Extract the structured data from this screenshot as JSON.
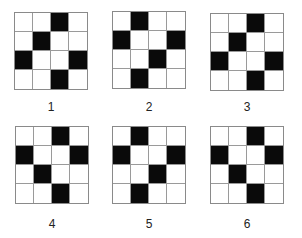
{
  "figure": {
    "grid_size": 4,
    "fill_color": "#0a0a0a",
    "panels": [
      {
        "label": "1",
        "cells": [
          [
            0,
            0,
            1,
            0
          ],
          [
            0,
            1,
            0,
            0
          ],
          [
            1,
            0,
            0,
            1
          ],
          [
            0,
            0,
            1,
            0
          ]
        ]
      },
      {
        "label": "2",
        "cells": [
          [
            0,
            1,
            0,
            0
          ],
          [
            1,
            0,
            0,
            1
          ],
          [
            0,
            0,
            1,
            0
          ],
          [
            0,
            1,
            0,
            0
          ]
        ]
      },
      {
        "label": "3",
        "cells": [
          [
            0,
            0,
            1,
            0
          ],
          [
            0,
            1,
            0,
            0
          ],
          [
            1,
            0,
            0,
            1
          ],
          [
            0,
            0,
            1,
            0
          ]
        ]
      },
      {
        "label": "4",
        "cells": [
          [
            0,
            0,
            1,
            0
          ],
          [
            1,
            0,
            0,
            1
          ],
          [
            0,
            1,
            0,
            0
          ],
          [
            0,
            0,
            1,
            0
          ]
        ]
      },
      {
        "label": "5",
        "cells": [
          [
            0,
            1,
            0,
            0
          ],
          [
            1,
            0,
            0,
            1
          ],
          [
            0,
            0,
            1,
            0
          ],
          [
            0,
            1,
            0,
            0
          ]
        ]
      },
      {
        "label": "6",
        "cells": [
          [
            0,
            0,
            1,
            0
          ],
          [
            1,
            0,
            0,
            1
          ],
          [
            0,
            1,
            0,
            0
          ],
          [
            0,
            0,
            1,
            0
          ]
        ]
      }
    ]
  }
}
